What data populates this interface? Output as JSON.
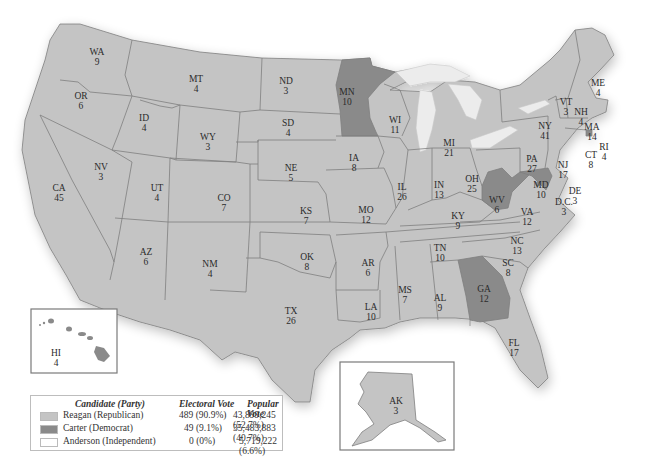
{
  "colors": {
    "republican": "#c4c4c4",
    "democrat": "#8a8a8a",
    "independent": "#ffffff",
    "border": "#7f7f7f"
  },
  "legend": {
    "headers": {
      "candidate": "Candidate (Party)",
      "electoral": "Electoral Vote",
      "popular": "Popular Vote"
    },
    "rows": [
      {
        "candidate": "Reagan (Republican)",
        "electoral": "489 (90.9%)",
        "popular": "43,899,245 (52.7%)",
        "color": "#c4c4c4"
      },
      {
        "candidate": "Carter (Democrat)",
        "electoral": "49 (9.1%)",
        "popular": "35,483,883 (40.7%)",
        "color": "#8a8a8a"
      },
      {
        "candidate": "Anderson (Independent)",
        "electoral": "0 (0%)",
        "popular": "5,719,222 (6.6%)",
        "color": "#ffffff"
      }
    ]
  },
  "states": [
    {
      "abbr": "WA",
      "ev": "9",
      "party": "R"
    },
    {
      "abbr": "OR",
      "ev": "6",
      "party": "R"
    },
    {
      "abbr": "CA",
      "ev": "45",
      "party": "R"
    },
    {
      "abbr": "ID",
      "ev": "4",
      "party": "R"
    },
    {
      "abbr": "NV",
      "ev": "3",
      "party": "R"
    },
    {
      "abbr": "MT",
      "ev": "4",
      "party": "R"
    },
    {
      "abbr": "WY",
      "ev": "3",
      "party": "R"
    },
    {
      "abbr": "UT",
      "ev": "4",
      "party": "R"
    },
    {
      "abbr": "AZ",
      "ev": "6",
      "party": "R"
    },
    {
      "abbr": "CO",
      "ev": "7",
      "party": "R"
    },
    {
      "abbr": "NM",
      "ev": "4",
      "party": "R"
    },
    {
      "abbr": "ND",
      "ev": "3",
      "party": "R"
    },
    {
      "abbr": "SD",
      "ev": "4",
      "party": "R"
    },
    {
      "abbr": "NE",
      "ev": "5",
      "party": "R"
    },
    {
      "abbr": "KS",
      "ev": "7",
      "party": "R"
    },
    {
      "abbr": "OK",
      "ev": "8",
      "party": "R"
    },
    {
      "abbr": "TX",
      "ev": "26",
      "party": "R"
    },
    {
      "abbr": "MN",
      "ev": "10",
      "party": "D"
    },
    {
      "abbr": "IA",
      "ev": "8",
      "party": "R"
    },
    {
      "abbr": "MO",
      "ev": "12",
      "party": "R"
    },
    {
      "abbr": "AR",
      "ev": "6",
      "party": "R"
    },
    {
      "abbr": "LA",
      "ev": "10",
      "party": "R"
    },
    {
      "abbr": "WI",
      "ev": "11",
      "party": "R"
    },
    {
      "abbr": "IL",
      "ev": "26",
      "party": "R"
    },
    {
      "abbr": "MI",
      "ev": "21",
      "party": "R"
    },
    {
      "abbr": "IN",
      "ev": "13",
      "party": "R"
    },
    {
      "abbr": "OH",
      "ev": "25",
      "party": "R"
    },
    {
      "abbr": "KY",
      "ev": "9",
      "party": "R"
    },
    {
      "abbr": "TN",
      "ev": "10",
      "party": "R"
    },
    {
      "abbr": "MS",
      "ev": "7",
      "party": "R"
    },
    {
      "abbr": "AL",
      "ev": "9",
      "party": "R"
    },
    {
      "abbr": "GA",
      "ev": "12",
      "party": "D"
    },
    {
      "abbr": "FL",
      "ev": "17",
      "party": "R"
    },
    {
      "abbr": "SC",
      "ev": "8",
      "party": "R"
    },
    {
      "abbr": "NC",
      "ev": "13",
      "party": "R"
    },
    {
      "abbr": "VA",
      "ev": "12",
      "party": "R"
    },
    {
      "abbr": "WV",
      "ev": "6",
      "party": "D"
    },
    {
      "abbr": "MD",
      "ev": "10",
      "party": "D"
    },
    {
      "abbr": "DE",
      "ev": "3",
      "party": "R"
    },
    {
      "abbr": "D.C.",
      "ev": "3",
      "party": "D"
    },
    {
      "abbr": "PA",
      "ev": "27",
      "party": "R"
    },
    {
      "abbr": "NJ",
      "ev": "17",
      "party": "R"
    },
    {
      "abbr": "NY",
      "ev": "41",
      "party": "R"
    },
    {
      "abbr": "CT",
      "ev": "8",
      "party": "R"
    },
    {
      "abbr": "RI",
      "ev": "4",
      "party": "D"
    },
    {
      "abbr": "MA",
      "ev": "14",
      "party": "R"
    },
    {
      "abbr": "VT",
      "ev": "3",
      "party": "R"
    },
    {
      "abbr": "NH",
      "ev": "4",
      "party": "R"
    },
    {
      "abbr": "ME",
      "ev": "4",
      "party": "R"
    },
    {
      "abbr": "AK",
      "ev": "3",
      "party": "R"
    },
    {
      "abbr": "HI",
      "ev": "4",
      "party": "D"
    }
  ]
}
